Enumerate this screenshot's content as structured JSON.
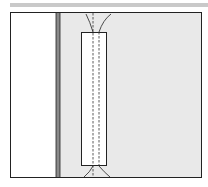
{
  "diagram": {
    "type": "sewing-illustration",
    "colors": {
      "top_bar": "#c9c9c9",
      "fabric": "#e9e9e9",
      "fold_strip": "#8a8a8a",
      "outline": "#222222",
      "strip": "#ffffff"
    },
    "elements": [
      "top-bar",
      "fabric-panel",
      "fold-edge",
      "stitched-strip",
      "stitch-line-left",
      "stitch-line-right",
      "thread-ends-top",
      "thread-ends-bottom"
    ]
  }
}
